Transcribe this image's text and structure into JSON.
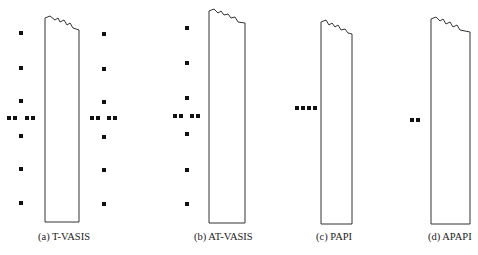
{
  "figure": {
    "panels": [
      {
        "id": "a",
        "caption": "(a) T-VASIS",
        "light_groups": [
          "left-vertical-column-6",
          "left-wing-bar-4",
          "right-vertical-column-6",
          "right-wing-bar-4"
        ]
      },
      {
        "id": "b",
        "caption": "(b) AT-VASIS",
        "light_groups": [
          "left-vertical-column-6",
          "left-wing-bar-4"
        ]
      },
      {
        "id": "c",
        "caption": "(c) PAPI",
        "light_groups": [
          "left-wing-bar-4"
        ]
      },
      {
        "id": "d",
        "caption": "(d) APAPI",
        "light_groups": [
          "left-wing-bar-2"
        ]
      }
    ],
    "colors": {
      "stroke": "#333333",
      "light": "#111111",
      "background": "#ffffff"
    }
  }
}
